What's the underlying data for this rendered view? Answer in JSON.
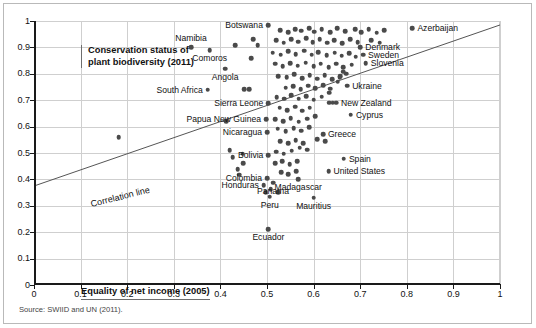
{
  "figure": {
    "title_lines": [
      "Conservation status of",
      "plant biodiversity (2011)"
    ],
    "x_caption": "Equality of net income (2005)",
    "correlation_label": "Correlation line",
    "source": "Source: SWIID and UN (2011)."
  },
  "chart_data": {
    "type": "scatter",
    "title": "Conservation status of plant biodiversity (2011)",
    "xlabel": "Equality of net income (2005)",
    "ylabel": "Conservation status of plant biodiversity (2011)",
    "xlim": [
      0,
      1
    ],
    "ylim": [
      0,
      1
    ],
    "grid": true,
    "legend": "none",
    "x_ticks": [
      "0",
      "0.1",
      "0.2",
      "0.3",
      "0.4",
      "0.5",
      "0.6",
      "0.7",
      "0.8",
      "0.9",
      "1"
    ],
    "x_tick_values": [
      0,
      0.1,
      0.2,
      0.3,
      0.4,
      0.5,
      0.6,
      0.7,
      0.8,
      0.9,
      1
    ],
    "y_ticks": [
      "0",
      "0.1",
      "0.2",
      "0.3",
      "0.4",
      "0.5",
      "0.6",
      "0.7",
      "0.8",
      "0.9",
      "1"
    ],
    "y_tick_values": [
      0,
      0.1,
      0.2,
      0.3,
      0.4,
      0.5,
      0.6,
      0.7,
      0.8,
      0.9,
      1
    ],
    "trendline": {
      "label": "Correlation line",
      "x0": 0.0,
      "y0": 0.375,
      "x1": 1.0,
      "y1": 0.985
    },
    "marker_color": "#4a4a4a",
    "labeled_points": [
      {
        "name": "Botswana",
        "x": 0.502,
        "y": 0.985,
        "label_pos": "left-of"
      },
      {
        "name": "Azerbaijan",
        "x": 0.812,
        "y": 0.972,
        "label_pos": "right-of"
      },
      {
        "name": "Namibia",
        "x": 0.337,
        "y": 0.9,
        "label_pos": "above"
      },
      {
        "name": "Comoros",
        "x": 0.377,
        "y": 0.89,
        "label_pos": "below"
      },
      {
        "name": "Denmark",
        "x": 0.7,
        "y": 0.9,
        "label_pos": "right-of"
      },
      {
        "name": "Sweden",
        "x": 0.706,
        "y": 0.872,
        "label_pos": "right-of"
      },
      {
        "name": "Slovenia",
        "x": 0.712,
        "y": 0.84,
        "label_pos": "right-of"
      },
      {
        "name": "Angola",
        "x": 0.41,
        "y": 0.82,
        "label_pos": "below"
      },
      {
        "name": "Ukraine",
        "x": 0.672,
        "y": 0.755,
        "label_pos": "right-of"
      },
      {
        "name": "South Africa",
        "x": 0.373,
        "y": 0.74,
        "label_pos": "left-of"
      },
      {
        "name": "Sierra Leone",
        "x": 0.503,
        "y": 0.688,
        "label_pos": "left-of"
      },
      {
        "name": "New Zealand",
        "x": 0.648,
        "y": 0.69,
        "label_pos": "right-of"
      },
      {
        "name": "Cyprus",
        "x": 0.68,
        "y": 0.645,
        "label_pos": "right-of"
      },
      {
        "name": "Papua New Guinea",
        "x": 0.498,
        "y": 0.627,
        "label_pos": "left-of"
      },
      {
        "name": "Nicaragua",
        "x": 0.5,
        "y": 0.578,
        "label_pos": "left-of"
      },
      {
        "name": "Greece",
        "x": 0.62,
        "y": 0.572,
        "label_pos": "right-of"
      },
      {
        "name": "Bolivia",
        "x": 0.503,
        "y": 0.492,
        "label_pos": "left-of"
      },
      {
        "name": "Spain",
        "x": 0.665,
        "y": 0.478,
        "label_pos": "right-of"
      },
      {
        "name": "United States",
        "x": 0.632,
        "y": 0.43,
        "label_pos": "right-of"
      },
      {
        "name": "Colombia",
        "x": 0.5,
        "y": 0.405,
        "label_pos": "left-of"
      },
      {
        "name": "Madagascar",
        "x": 0.567,
        "y": 0.4,
        "label_pos": "below"
      },
      {
        "name": "Honduras",
        "x": 0.493,
        "y": 0.378,
        "label_pos": "left-of"
      },
      {
        "name": "Panama",
        "x": 0.513,
        "y": 0.388,
        "label_pos": "below"
      },
      {
        "name": "Peru",
        "x": 0.506,
        "y": 0.335,
        "label_pos": "below"
      },
      {
        "name": "Mauritius",
        "x": 0.6,
        "y": 0.33,
        "label_pos": "below"
      },
      {
        "name": "Ecuador",
        "x": 0.503,
        "y": 0.212,
        "label_pos": "below"
      }
    ],
    "unlabeled_points": [
      {
        "x": 0.182,
        "y": 0.56
      },
      {
        "x": 0.432,
        "y": 0.908
      },
      {
        "x": 0.47,
        "y": 0.93
      },
      {
        "x": 0.48,
        "y": 0.908
      },
      {
        "x": 0.466,
        "y": 0.858
      },
      {
        "x": 0.451,
        "y": 0.742
      },
      {
        "x": 0.462,
        "y": 0.742
      },
      {
        "x": 0.448,
        "y": 0.497
      },
      {
        "x": 0.449,
        "y": 0.462
      },
      {
        "x": 0.437,
        "y": 0.438
      },
      {
        "x": 0.44,
        "y": 0.418
      },
      {
        "x": 0.528,
        "y": 0.965
      },
      {
        "x": 0.545,
        "y": 0.958
      },
      {
        "x": 0.56,
        "y": 0.97
      },
      {
        "x": 0.573,
        "y": 0.963
      },
      {
        "x": 0.59,
        "y": 0.972
      },
      {
        "x": 0.601,
        "y": 0.96
      },
      {
        "x": 0.617,
        "y": 0.968
      },
      {
        "x": 0.635,
        "y": 0.958
      },
      {
        "x": 0.651,
        "y": 0.972
      },
      {
        "x": 0.668,
        "y": 0.962
      },
      {
        "x": 0.689,
        "y": 0.97
      },
      {
        "x": 0.702,
        "y": 0.958
      },
      {
        "x": 0.718,
        "y": 0.968
      },
      {
        "x": 0.735,
        "y": 0.955
      },
      {
        "x": 0.752,
        "y": 0.965
      },
      {
        "x": 0.52,
        "y": 0.928
      },
      {
        "x": 0.536,
        "y": 0.918
      },
      {
        "x": 0.552,
        "y": 0.932
      },
      {
        "x": 0.567,
        "y": 0.922
      },
      {
        "x": 0.584,
        "y": 0.935
      },
      {
        "x": 0.598,
        "y": 0.92
      },
      {
        "x": 0.613,
        "y": 0.93
      },
      {
        "x": 0.629,
        "y": 0.918
      },
      {
        "x": 0.644,
        "y": 0.928
      },
      {
        "x": 0.662,
        "y": 0.915
      },
      {
        "x": 0.678,
        "y": 0.93
      },
      {
        "x": 0.695,
        "y": 0.92
      },
      {
        "x": 0.724,
        "y": 0.928
      },
      {
        "x": 0.742,
        "y": 0.918
      },
      {
        "x": 0.512,
        "y": 0.88
      },
      {
        "x": 0.529,
        "y": 0.872
      },
      {
        "x": 0.546,
        "y": 0.885
      },
      {
        "x": 0.562,
        "y": 0.875
      },
      {
        "x": 0.58,
        "y": 0.888
      },
      {
        "x": 0.596,
        "y": 0.872
      },
      {
        "x": 0.61,
        "y": 0.882
      },
      {
        "x": 0.628,
        "y": 0.87
      },
      {
        "x": 0.645,
        "y": 0.88
      },
      {
        "x": 0.66,
        "y": 0.868
      },
      {
        "x": 0.676,
        "y": 0.878
      },
      {
        "x": 0.69,
        "y": 0.865
      },
      {
        "x": 0.517,
        "y": 0.838
      },
      {
        "x": 0.534,
        "y": 0.828
      },
      {
        "x": 0.55,
        "y": 0.84
      },
      {
        "x": 0.566,
        "y": 0.83
      },
      {
        "x": 0.583,
        "y": 0.842
      },
      {
        "x": 0.6,
        "y": 0.828
      },
      {
        "x": 0.615,
        "y": 0.838
      },
      {
        "x": 0.632,
        "y": 0.826
      },
      {
        "x": 0.648,
        "y": 0.838
      },
      {
        "x": 0.664,
        "y": 0.824
      },
      {
        "x": 0.682,
        "y": 0.835
      },
      {
        "x": 0.524,
        "y": 0.792
      },
      {
        "x": 0.542,
        "y": 0.786
      },
      {
        "x": 0.558,
        "y": 0.798
      },
      {
        "x": 0.576,
        "y": 0.784
      },
      {
        "x": 0.592,
        "y": 0.795
      },
      {
        "x": 0.608,
        "y": 0.782
      },
      {
        "x": 0.624,
        "y": 0.794
      },
      {
        "x": 0.64,
        "y": 0.78
      },
      {
        "x": 0.657,
        "y": 0.792
      },
      {
        "x": 0.67,
        "y": 0.8
      },
      {
        "x": 0.664,
        "y": 0.808
      },
      {
        "x": 0.54,
        "y": 0.748
      },
      {
        "x": 0.556,
        "y": 0.752
      },
      {
        "x": 0.572,
        "y": 0.742
      },
      {
        "x": 0.588,
        "y": 0.755
      },
      {
        "x": 0.604,
        "y": 0.745
      },
      {
        "x": 0.62,
        "y": 0.757
      },
      {
        "x": 0.636,
        "y": 0.744
      },
      {
        "x": 0.652,
        "y": 0.77
      },
      {
        "x": 0.656,
        "y": 0.786
      },
      {
        "x": 0.521,
        "y": 0.712
      },
      {
        "x": 0.537,
        "y": 0.705
      },
      {
        "x": 0.552,
        "y": 0.718
      },
      {
        "x": 0.568,
        "y": 0.706
      },
      {
        "x": 0.584,
        "y": 0.716
      },
      {
        "x": 0.6,
        "y": 0.702
      },
      {
        "x": 0.617,
        "y": 0.714
      },
      {
        "x": 0.634,
        "y": 0.728
      },
      {
        "x": 0.527,
        "y": 0.672
      },
      {
        "x": 0.543,
        "y": 0.662
      },
      {
        "x": 0.56,
        "y": 0.675
      },
      {
        "x": 0.575,
        "y": 0.66
      },
      {
        "x": 0.592,
        "y": 0.672
      },
      {
        "x": 0.634,
        "y": 0.69
      },
      {
        "x": 0.641,
        "y": 0.69
      },
      {
        "x": 0.518,
        "y": 0.628
      },
      {
        "x": 0.535,
        "y": 0.62
      },
      {
        "x": 0.551,
        "y": 0.632
      },
      {
        "x": 0.568,
        "y": 0.618
      },
      {
        "x": 0.586,
        "y": 0.63
      },
      {
        "x": 0.604,
        "y": 0.64
      },
      {
        "x": 0.523,
        "y": 0.592
      },
      {
        "x": 0.54,
        "y": 0.582
      },
      {
        "x": 0.557,
        "y": 0.595
      },
      {
        "x": 0.573,
        "y": 0.585
      },
      {
        "x": 0.59,
        "y": 0.598
      },
      {
        "x": 0.528,
        "y": 0.545
      },
      {
        "x": 0.545,
        "y": 0.538
      },
      {
        "x": 0.562,
        "y": 0.548
      },
      {
        "x": 0.578,
        "y": 0.536
      },
      {
        "x": 0.608,
        "y": 0.552
      },
      {
        "x": 0.625,
        "y": 0.545
      },
      {
        "x": 0.52,
        "y": 0.505
      },
      {
        "x": 0.536,
        "y": 0.498
      },
      {
        "x": 0.553,
        "y": 0.508
      },
      {
        "x": 0.57,
        "y": 0.52
      },
      {
        "x": 0.586,
        "y": 0.512
      },
      {
        "x": 0.517,
        "y": 0.462
      },
      {
        "x": 0.533,
        "y": 0.47
      },
      {
        "x": 0.549,
        "y": 0.458
      },
      {
        "x": 0.565,
        "y": 0.468
      },
      {
        "x": 0.53,
        "y": 0.428
      },
      {
        "x": 0.546,
        "y": 0.42
      },
      {
        "x": 0.563,
        "y": 0.432
      },
      {
        "x": 0.508,
        "y": 0.362
      },
      {
        "x": 0.524,
        "y": 0.352
      },
      {
        "x": 0.497,
        "y": 0.352
      },
      {
        "x": 0.413,
        "y": 0.62
      },
      {
        "x": 0.42,
        "y": 0.51
      },
      {
        "x": 0.426,
        "y": 0.485
      }
    ]
  }
}
